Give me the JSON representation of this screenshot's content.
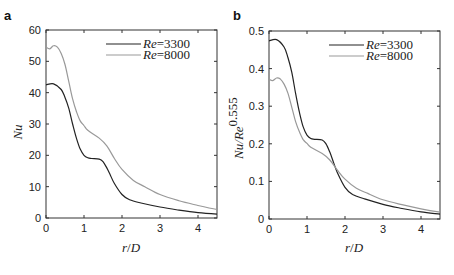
{
  "chart_data": [
    {
      "panel": "a",
      "type": "line",
      "title": "",
      "xlabel": "r/D",
      "ylabel": "Nu",
      "xlim": [
        0,
        4.5
      ],
      "ylim": [
        0,
        60
      ],
      "xticks": [
        0,
        1,
        2,
        3,
        4
      ],
      "yticks": [
        0,
        10,
        20,
        30,
        40,
        50,
        60
      ],
      "grid": false,
      "legend_position": "upper right",
      "series": [
        {
          "name": "Re=3300",
          "color": "#222222",
          "x": [
            0,
            0.2,
            0.4,
            0.5,
            0.6,
            0.7,
            0.8,
            0.9,
            1.0,
            1.1,
            1.2,
            1.4,
            1.5,
            1.6,
            1.7,
            1.8,
            2.0,
            2.2,
            2.5,
            3.0,
            3.5,
            4.0,
            4.5
          ],
          "values": [
            42.5,
            42.8,
            41,
            38.5,
            35,
            30,
            25.5,
            22,
            20,
            19.2,
            19,
            18.8,
            18,
            16,
            13.5,
            11,
            7.5,
            5.8,
            4.8,
            3.5,
            2.5,
            1.7,
            1.2
          ]
        },
        {
          "name": "Re=8000",
          "color": "#999999",
          "x": [
            0,
            0.1,
            0.2,
            0.3,
            0.4,
            0.5,
            0.6,
            0.7,
            0.8,
            0.9,
            1.0,
            1.1,
            1.4,
            1.6,
            1.8,
            2.0,
            2.3,
            2.6,
            3.0,
            3.5,
            4.0,
            4.5
          ],
          "values": [
            54.5,
            54,
            55,
            54.5,
            52.5,
            49,
            43.5,
            38,
            34,
            31,
            29.5,
            28,
            25.5,
            23,
            19,
            15.5,
            12,
            10,
            7.5,
            5.5,
            4,
            2.7
          ]
        }
      ]
    },
    {
      "panel": "b",
      "type": "line",
      "title": "",
      "xlabel": "r/D",
      "ylabel": "Nu/Re^0.555",
      "xlim": [
        0,
        4.5
      ],
      "ylim": [
        0,
        0.5
      ],
      "xticks": [
        0,
        1,
        2,
        3,
        4
      ],
      "yticks": [
        0,
        0.1,
        0.2,
        0.3,
        0.4,
        0.5
      ],
      "grid": false,
      "legend_position": "upper right",
      "series": [
        {
          "name": "Re=3300",
          "color": "#222222",
          "x": [
            0,
            0.2,
            0.4,
            0.5,
            0.6,
            0.7,
            0.8,
            0.9,
            1.0,
            1.1,
            1.2,
            1.4,
            1.5,
            1.6,
            1.7,
            1.8,
            2.0,
            2.2,
            2.5,
            3.0,
            3.5,
            4.0,
            4.5
          ],
          "values": [
            0.474,
            0.477,
            0.457,
            0.429,
            0.39,
            0.334,
            0.284,
            0.245,
            0.223,
            0.214,
            0.212,
            0.21,
            0.2,
            0.178,
            0.15,
            0.123,
            0.084,
            0.065,
            0.054,
            0.039,
            0.028,
            0.019,
            0.013
          ]
        },
        {
          "name": "Re=8000",
          "color": "#999999",
          "x": [
            0,
            0.1,
            0.2,
            0.3,
            0.4,
            0.5,
            0.6,
            0.7,
            0.8,
            0.9,
            1.0,
            1.1,
            1.4,
            1.6,
            1.8,
            2.0,
            2.3,
            2.6,
            3.0,
            3.5,
            4.0,
            4.5
          ],
          "values": [
            0.372,
            0.368,
            0.375,
            0.372,
            0.358,
            0.334,
            0.297,
            0.259,
            0.232,
            0.211,
            0.201,
            0.191,
            0.174,
            0.157,
            0.13,
            0.106,
            0.082,
            0.068,
            0.051,
            0.038,
            0.027,
            0.018
          ]
        }
      ]
    }
  ],
  "panels": {
    "a": {
      "label": "a",
      "ylabel": "Nu",
      "xlabel_r": "r",
      "xlabel_slash": "/",
      "xlabel_D": "D",
      "yticks": [
        "0",
        "10",
        "20",
        "30",
        "40",
        "50",
        "60"
      ],
      "xticks": [
        "0",
        "1",
        "2",
        "3",
        "4"
      ],
      "legend": [
        {
          "re": "Re",
          "eq": "=3300"
        },
        {
          "re": "Re",
          "eq": "=8000"
        }
      ]
    },
    "b": {
      "label": "b",
      "ylabel_nu": "Nu/Re",
      "ylabel_exp": "0.555",
      "xlabel_r": "r",
      "xlabel_slash": "/",
      "xlabel_D": "D",
      "yticks": [
        "0",
        "0.1",
        "0.2",
        "0.3",
        "0.4",
        "0.5"
      ],
      "xticks": [
        "0",
        "1",
        "2",
        "3",
        "4"
      ],
      "legend": [
        {
          "re": "Re",
          "eq": "=3300"
        },
        {
          "re": "Re",
          "eq": "=8000"
        }
      ]
    }
  }
}
